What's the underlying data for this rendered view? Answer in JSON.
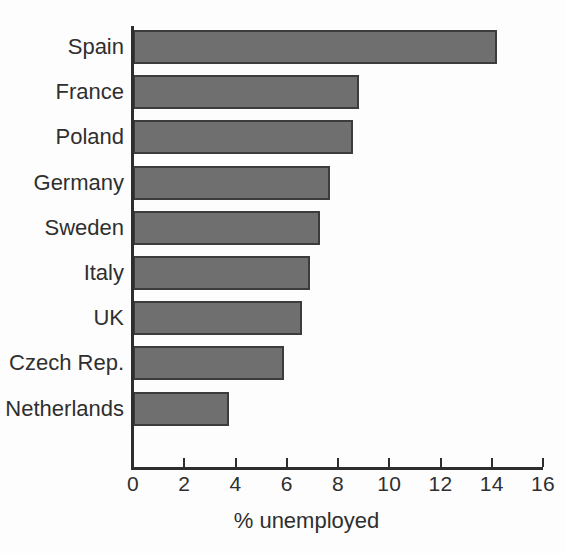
{
  "chart_data": {
    "type": "bar",
    "orientation": "horizontal",
    "title": "",
    "subtitle": "",
    "xlabel": "% unemployed",
    "ylabel": "",
    "xlim": [
      0,
      16
    ],
    "xticks": [
      0,
      2,
      4,
      6,
      8,
      10,
      12,
      14,
      16
    ],
    "xtick_labels": [
      "0",
      "2",
      "4",
      "6",
      "8",
      "10",
      "12",
      "14",
      "16"
    ],
    "grid": false,
    "legend": false,
    "legend_position": "none",
    "categories": [
      "Spain",
      "France",
      "Poland",
      "Germany",
      "Sweden",
      "Italy",
      "UK",
      "Czech Rep.",
      "Netherlands"
    ],
    "values": [
      14.2,
      8.8,
      8.6,
      7.7,
      7.3,
      6.9,
      6.6,
      5.9,
      3.75
    ],
    "series": [
      {
        "name": "% unemployed",
        "values": [
          14.2,
          8.8,
          8.6,
          7.7,
          7.3,
          6.9,
          6.6,
          5.9,
          3.75
        ]
      }
    ],
    "bars": [
      {
        "label": "Spain",
        "value": 14.2
      },
      {
        "label": "France",
        "value": 8.8
      },
      {
        "label": "Poland",
        "value": 8.6
      },
      {
        "label": "Germany",
        "value": 7.7
      },
      {
        "label": "Sweden",
        "value": 7.3
      },
      {
        "label": "Italy",
        "value": 6.9
      },
      {
        "label": "UK",
        "value": 6.6
      },
      {
        "label": "Czech Rep.",
        "value": 5.9
      },
      {
        "label": "Netherlands",
        "value": 3.75
      }
    ],
    "colors": {
      "bar_fill": "#6f6f6f",
      "bar_border": "#3c3c3c",
      "axis": "#2e2e2e",
      "text": "#2f2f2f",
      "background": "#fdfdfd"
    }
  }
}
